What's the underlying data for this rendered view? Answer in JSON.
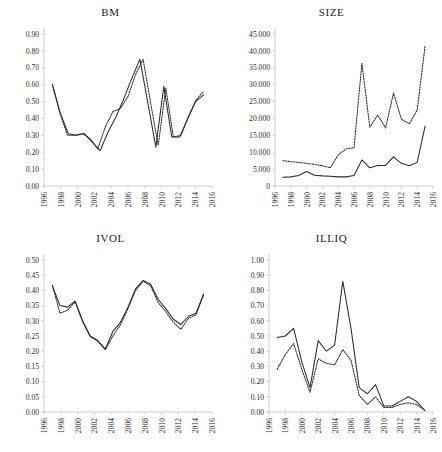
{
  "figure": {
    "panels": [
      "BM",
      "SIZE",
      "IVOL",
      "ILLIQ"
    ]
  },
  "chart_data": [
    {
      "type": "line",
      "title": "BM",
      "xlabel": "",
      "ylabel": "",
      "xlim": [
        1996,
        2016
      ],
      "ylim": [
        0.0,
        0.9
      ],
      "ytick_labels": [
        "0.00",
        "0.10",
        "0.20",
        "0.30",
        "0.40",
        "0.50",
        "0.60",
        "0.70",
        "0.80",
        "0.90"
      ],
      "ytick_values": [
        0.0,
        0.1,
        0.2,
        0.3,
        0.4,
        0.5,
        0.6,
        0.7,
        0.8,
        0.9
      ],
      "xtick_labels": [
        "1996",
        "1998",
        "2000",
        "2002",
        "2004",
        "2006",
        "2008",
        "2010",
        "2012",
        "2014",
        "2016"
      ],
      "xtick_values": [
        1996,
        1998,
        2000,
        2002,
        2004,
        2006,
        2008,
        2010,
        2012,
        2014,
        2016
      ],
      "grid": false,
      "legend": "none",
      "x": [
        1997,
        1998,
        1999,
        2000,
        2001,
        2002,
        2003,
        2004,
        2005,
        2006,
        2007,
        2008,
        2009,
        2010,
        2011,
        2012,
        2013,
        2014,
        2015
      ],
      "series": [
        {
          "name": "solid",
          "style": "solid",
          "values": [
            0.6,
            0.43,
            0.31,
            0.3,
            0.31,
            0.26,
            0.21,
            0.32,
            0.41,
            0.52,
            0.64,
            0.75,
            0.49,
            0.23,
            0.59,
            0.29,
            0.29,
            0.4,
            0.5,
            0.54
          ]
        },
        {
          "name": "dotted",
          "style": "dotted",
          "values": [
            0.6,
            0.43,
            0.3,
            0.3,
            0.31,
            0.28,
            0.22,
            0.35,
            0.44,
            0.46,
            0.53,
            0.66,
            0.75,
            0.49,
            0.24,
            0.58,
            0.29,
            0.3,
            0.41,
            0.51,
            0.56
          ]
        }
      ]
    },
    {
      "type": "line",
      "title": "SIZE",
      "xlabel": "",
      "ylabel": "",
      "xlim": [
        1996,
        2016
      ],
      "ylim": [
        0,
        45000
      ],
      "ytick_labels": [
        "0",
        "5.000",
        "10.000",
        "15.000",
        "20.000",
        "25.000",
        "30.000",
        "35.000",
        "40.000",
        "45.000"
      ],
      "ytick_values": [
        0,
        5000,
        10000,
        15000,
        20000,
        25000,
        30000,
        35000,
        40000,
        45000
      ],
      "xtick_labels": [
        "1996",
        "1998",
        "2000",
        "2002",
        "2004",
        "2006",
        "2008",
        "2010",
        "2012",
        "2014",
        "2016"
      ],
      "xtick_values": [
        1996,
        1998,
        2000,
        2002,
        2004,
        2006,
        2008,
        2010,
        2012,
        2014,
        2016
      ],
      "grid": false,
      "legend": "none",
      "x": [
        1997,
        1998,
        1999,
        2000,
        2001,
        2002,
        2003,
        2004,
        2005,
        2006,
        2007,
        2008,
        2009,
        2010,
        2011,
        2012,
        2013,
        2014,
        2015
      ],
      "series": [
        {
          "name": "solid",
          "style": "solid",
          "values": [
            2600,
            2700,
            3100,
            4300,
            3200,
            3000,
            2900,
            2700,
            2700,
            3100,
            7700,
            5400,
            6100,
            6100,
            8600,
            6700,
            6000,
            7000,
            17700
          ]
        },
        {
          "name": "dotted",
          "style": "dotted",
          "values": [
            7500,
            7200,
            7000,
            6700,
            6400,
            6000,
            5400,
            9200,
            11000,
            11300,
            36300,
            17400,
            21000,
            17200,
            27500,
            19800,
            18400,
            22500,
            41500
          ]
        }
      ]
    },
    {
      "type": "line",
      "title": "IVOL",
      "xlabel": "",
      "ylabel": "",
      "xlim": [
        1996,
        2016
      ],
      "ylim": [
        0.0,
        0.5
      ],
      "ytick_labels": [
        "0.00",
        "0.05",
        "0.10",
        "0.15",
        "0.20",
        "0.25",
        "0.30",
        "0.35",
        "0.40",
        "0.45",
        "0.50"
      ],
      "ytick_values": [
        0.0,
        0.05,
        0.1,
        0.15,
        0.2,
        0.25,
        0.3,
        0.35,
        0.4,
        0.45,
        0.5
      ],
      "xtick_labels": [
        "1996",
        "1998",
        "2000",
        "2002",
        "2004",
        "2006",
        "2008",
        "2010",
        "2012",
        "2014",
        "2016"
      ],
      "xtick_values": [
        1996,
        1998,
        2000,
        2002,
        2004,
        2006,
        2008,
        2010,
        2012,
        2014,
        2016
      ],
      "grid": false,
      "legend": "none",
      "x": [
        1997,
        1998,
        1999,
        2000,
        2001,
        2002,
        2003,
        2004,
        2005,
        2006,
        2007,
        2008,
        2009,
        2010,
        2011,
        2012,
        2013,
        2014,
        2015
      ],
      "series": [
        {
          "name": "solid",
          "style": "solid",
          "values": [
            0.415,
            0.35,
            0.345,
            0.365,
            0.3,
            0.25,
            0.235,
            0.207,
            0.265,
            0.295,
            0.345,
            0.405,
            0.433,
            0.42,
            0.37,
            0.34,
            0.305,
            0.288,
            0.315,
            0.325,
            0.388
          ]
        },
        {
          "name": "dotted",
          "style": "dotted",
          "values": [
            0.417,
            0.325,
            0.335,
            0.362,
            0.297,
            0.248,
            0.233,
            0.205,
            0.25,
            0.287,
            0.34,
            0.4,
            0.43,
            0.415,
            0.36,
            0.33,
            0.295,
            0.272,
            0.308,
            0.32,
            0.385
          ]
        }
      ]
    },
    {
      "type": "line",
      "title": "ILLIQ",
      "xlabel": "",
      "ylabel": "",
      "xlim": [
        1996,
        2016
      ],
      "ylim": [
        0.0,
        1.0
      ],
      "ytick_labels": [
        "0.00",
        "0.10",
        "0.20",
        "0.30",
        "0.40",
        "0.50",
        "0.60",
        "0.70",
        "0.80",
        "0.90",
        "1.00"
      ],
      "ytick_values": [
        0.0,
        0.1,
        0.2,
        0.3,
        0.4,
        0.5,
        0.6,
        0.7,
        0.8,
        0.9,
        1.0
      ],
      "xtick_labels": [
        "1996",
        "1998",
        "2000",
        "2002",
        "2004",
        "2006",
        "2008",
        "2010",
        "2012",
        "2014",
        "2016"
      ],
      "xtick_values": [
        1996,
        1998,
        2000,
        2002,
        2004,
        2006,
        2008,
        2010,
        2012,
        2014,
        2016
      ],
      "grid": false,
      "legend": "none",
      "x": [
        1997,
        1998,
        1999,
        2000,
        2001,
        2002,
        2003,
        2004,
        2005,
        2006,
        2007,
        2008,
        2009,
        2010,
        2011,
        2012,
        2013,
        2014,
        2015
      ],
      "series": [
        {
          "name": "solid",
          "style": "solid",
          "values": [
            0.49,
            0.5,
            0.55,
            0.33,
            0.16,
            0.47,
            0.4,
            0.44,
            0.86,
            0.55,
            0.16,
            0.12,
            0.18,
            0.04,
            0.04,
            0.07,
            0.1,
            0.07,
            0.01
          ]
        },
        {
          "name": "dotted",
          "style": "dotted",
          "values": [
            0.28,
            0.38,
            0.45,
            0.28,
            0.13,
            0.35,
            0.32,
            0.31,
            0.41,
            0.34,
            0.11,
            0.05,
            0.1,
            0.03,
            0.03,
            0.05,
            0.06,
            0.05,
            0.01
          ]
        }
      ]
    }
  ],
  "colors": {
    "line": "#2b2b2b",
    "axis": "#b9b9b9",
    "text": "#1a1a1a",
    "background": "#ffffff"
  }
}
